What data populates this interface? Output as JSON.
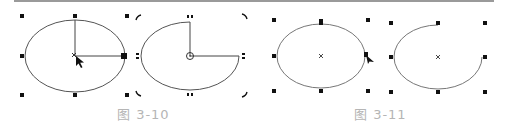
{
  "figures": [
    {
      "id": "3-10",
      "caption": "图 3-10",
      "panels": [
        {
          "name": "ellipse-with-radius-lines",
          "description": "Selected ellipse with handles; radius lines drawn from center; arrow cursor"
        },
        {
          "name": "pie-with-rotate-handles",
          "description": "Pie shape (missing top-right quadrant) with rotate/skew handles and center marker"
        }
      ]
    },
    {
      "id": "3-11",
      "caption": "图 3-11",
      "panels": [
        {
          "name": "ellipse-node-drag",
          "description": "Selected ellipse with node being dragged; arrow cursor"
        },
        {
          "name": "arc-result",
          "description": "Open arc result (missing top-right quadrant) with selection handles"
        }
      ]
    }
  ],
  "colors": {
    "stroke": "#444444",
    "handle": "#111111",
    "caption": "#b5b5b5",
    "topline": "#9a9a9a"
  }
}
